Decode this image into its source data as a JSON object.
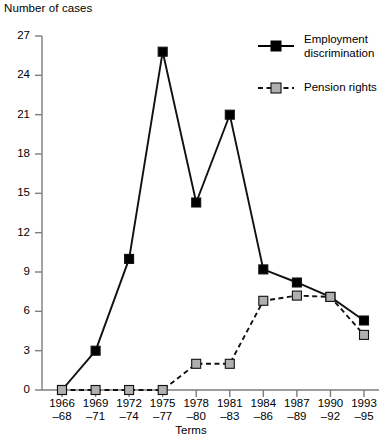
{
  "chart_data": {
    "type": "line",
    "title": "",
    "ylabel": "Number of cases",
    "xlabel": "Terms",
    "ylim": [
      0,
      27
    ],
    "yticks": [
      0,
      3,
      6,
      9,
      12,
      15,
      18,
      21,
      24,
      27
    ],
    "grid": false,
    "legend_position": "top-right",
    "categories": [
      "1966–68",
      "1969–71",
      "1972–74",
      "1975–77",
      "1978–80",
      "1981–83",
      "1984–86",
      "1987–89",
      "1990–92",
      "1993–95"
    ],
    "categories_top": [
      "1966",
      "1969",
      "1972",
      "1975",
      "1978",
      "1981",
      "1984",
      "1987",
      "1990",
      "1993"
    ],
    "categories_bottom": [
      "–68",
      "–71",
      "–74",
      "–77",
      "–80",
      "–83",
      "–86",
      "–89",
      "–92",
      "–95"
    ],
    "series": [
      {
        "name": "Employment discrimination",
        "style": "solid",
        "marker": "filled-square",
        "color": "#000000",
        "values": [
          0,
          3,
          10,
          25.8,
          14.3,
          21,
          9.2,
          8.2,
          7.1,
          5.3
        ]
      },
      {
        "name": "Pension rights",
        "style": "dashed",
        "marker": "gray-square",
        "color": "#9a9a9a",
        "values": [
          0,
          0,
          0,
          0,
          2,
          2,
          6.8,
          7.2,
          7.1,
          4.2
        ]
      }
    ]
  },
  "legend": {
    "items": [
      {
        "label_line1": "Employment",
        "label_line2": "discrimination"
      },
      {
        "label_line1": "Pension rights",
        "label_line2": ""
      }
    ]
  },
  "axes": {
    "y_title": "Number of cases",
    "x_title": "Terms"
  }
}
